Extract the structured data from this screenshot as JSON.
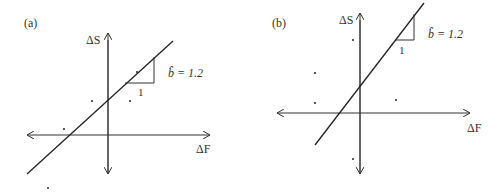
{
  "panels": [
    {
      "id": "a",
      "label": "(a)",
      "y_axis_label": "ΔS",
      "x_axis_label": "ΔF",
      "slope_label": "b̂ = 1.2",
      "slope_run_label": "1",
      "slope_value": 1.2,
      "points": [
        [
          64,
          129
        ],
        [
          92,
          101
        ],
        [
          130,
          101
        ],
        [
          137,
          72
        ],
        [
          48,
          188
        ]
      ]
    },
    {
      "id": "b",
      "label": "(b)",
      "y_axis_label": "ΔS",
      "x_axis_label": "ΔF",
      "slope_label": "b̂ = 1.2",
      "slope_run_label": "1",
      "slope_value": 1.2,
      "points": [
        [
          353,
          40
        ],
        [
          315,
          73
        ],
        [
          315,
          103
        ],
        [
          396,
          100
        ],
        [
          353,
          159
        ]
      ]
    }
  ],
  "colors": {
    "ink": "#333333",
    "background": "#ffffff"
  }
}
